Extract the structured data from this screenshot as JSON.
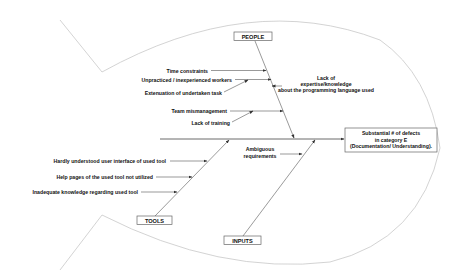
{
  "diagram": {
    "type": "fishbone",
    "effect": {
      "line1": "Substantial # of defects",
      "line2": "in category E",
      "line3": "(Documentation/ Understanding)."
    },
    "categories": {
      "people": {
        "label": "PEOPLE",
        "causes": [
          "Time constraints",
          "Unpracticed / inexperienced workers",
          "Extenuation of undertaken task",
          "Team mismanagement",
          "Lack of training"
        ],
        "side_cause": {
          "line1": "Lack of",
          "line2": "expertise/knowledge",
          "line3": "about the programming language used"
        }
      },
      "tools": {
        "label": "TOOLS",
        "causes": [
          "Hardly understood user interface of used tool",
          "Help pages of the used tool not utilized",
          "Inadequate knowledge regarding used tool"
        ]
      },
      "inputs": {
        "label": "INPUTS",
        "causes": [
          {
            "line1": "Ambiguous",
            "line2": "requirements"
          }
        ]
      }
    },
    "colors": {
      "outline": "#c8c8c8",
      "bones": "#555555",
      "text": "#111111"
    }
  }
}
